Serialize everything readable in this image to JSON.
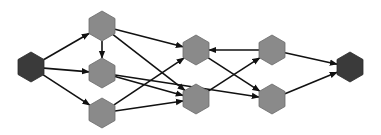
{
  "diagram": {
    "type": "directed-graph",
    "colors": {
      "terminal_node": "#3a3a3a",
      "intermediate_node": "#8a8a8a",
      "edge": "#111111",
      "background": "#ffffff"
    },
    "nodes": [
      {
        "id": "S",
        "role": "source",
        "shape": "hexagon",
        "x": 31,
        "y": 67
      },
      {
        "id": "A",
        "role": "intermediate",
        "shape": "hexagon",
        "x": 102,
        "y": 26
      },
      {
        "id": "B",
        "role": "intermediate",
        "shape": "hexagon",
        "x": 102,
        "y": 73
      },
      {
        "id": "C",
        "role": "intermediate",
        "shape": "hexagon",
        "x": 102,
        "y": 113
      },
      {
        "id": "D",
        "role": "intermediate",
        "shape": "hexagon",
        "x": 196,
        "y": 50
      },
      {
        "id": "E",
        "role": "intermediate",
        "shape": "hexagon",
        "x": 196,
        "y": 99
      },
      {
        "id": "F",
        "role": "intermediate",
        "shape": "hexagon",
        "x": 272,
        "y": 50
      },
      {
        "id": "G",
        "role": "intermediate",
        "shape": "hexagon",
        "x": 272,
        "y": 99
      },
      {
        "id": "T",
        "role": "sink",
        "shape": "hexagon",
        "x": 350,
        "y": 67
      }
    ],
    "edges": [
      {
        "from": "S",
        "to": "A"
      },
      {
        "from": "S",
        "to": "B"
      },
      {
        "from": "S",
        "to": "C"
      },
      {
        "from": "A",
        "to": "B"
      },
      {
        "from": "A",
        "to": "D"
      },
      {
        "from": "A",
        "to": "E"
      },
      {
        "from": "B",
        "to": "G"
      },
      {
        "from": "B",
        "to": "E"
      },
      {
        "from": "C",
        "to": "D"
      },
      {
        "from": "C",
        "to": "E"
      },
      {
        "from": "E",
        "to": "F"
      },
      {
        "from": "D",
        "to": "G"
      },
      {
        "from": "F",
        "to": "D"
      },
      {
        "from": "F",
        "to": "T"
      },
      {
        "from": "G",
        "to": "T"
      }
    ]
  }
}
